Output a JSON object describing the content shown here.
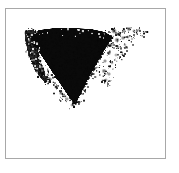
{
  "image": {
    "width": 179,
    "height": 173,
    "background_color": "#ffffff",
    "alt_label": "grainy dark ink blot shape"
  },
  "frame": {
    "name": "image-border-frame",
    "x": 5,
    "y": 8,
    "width": 161,
    "height": 151,
    "border_color": "#a8a8a8",
    "border_width": 1,
    "fill_color": "#ffffff"
  },
  "blob": {
    "name": "ink-blot-shape",
    "description": "dark grainy wedge tapering downward to a point",
    "ink_color": "#0a0a0a",
    "speckle_color": "#555555",
    "bounds": {
      "left": 24,
      "top": 26,
      "right": 148,
      "bottom": 108
    },
    "core_polygon": [
      [
        30,
        34
      ],
      [
        38,
        29
      ],
      [
        54,
        27
      ],
      [
        72,
        27
      ],
      [
        90,
        28
      ],
      [
        104,
        31
      ],
      [
        112,
        36
      ],
      [
        104,
        48
      ],
      [
        96,
        62
      ],
      [
        88,
        76
      ],
      [
        80,
        92
      ],
      [
        74,
        104
      ],
      [
        68,
        96
      ],
      [
        60,
        84
      ],
      [
        52,
        72
      ],
      [
        44,
        60
      ],
      [
        36,
        48
      ],
      [
        30,
        40
      ]
    ],
    "left_wing_polygon": [
      [
        24,
        30
      ],
      [
        34,
        28
      ],
      [
        40,
        38
      ],
      [
        38,
        54
      ],
      [
        42,
        68
      ],
      [
        50,
        80
      ],
      [
        44,
        82
      ],
      [
        34,
        70
      ],
      [
        27,
        52
      ],
      [
        24,
        38
      ]
    ],
    "speckles": [
      {
        "x": 113,
        "y": 30,
        "r": 3.0,
        "a": 0.8
      },
      {
        "x": 118,
        "y": 33,
        "r": 2.6,
        "a": 0.7
      },
      {
        "x": 123,
        "y": 30,
        "r": 2.2,
        "a": 0.62
      },
      {
        "x": 128,
        "y": 28,
        "r": 2.6,
        "a": 0.72
      },
      {
        "x": 133,
        "y": 30,
        "r": 2.0,
        "a": 0.55
      },
      {
        "x": 138,
        "y": 29,
        "r": 1.8,
        "a": 0.48
      },
      {
        "x": 143,
        "y": 31,
        "r": 1.5,
        "a": 0.35
      },
      {
        "x": 116,
        "y": 39,
        "r": 2.8,
        "a": 0.72
      },
      {
        "x": 122,
        "y": 37,
        "r": 2.4,
        "a": 0.6
      },
      {
        "x": 127,
        "y": 36,
        "r": 2.0,
        "a": 0.52
      },
      {
        "x": 131,
        "y": 38,
        "r": 1.7,
        "a": 0.42
      },
      {
        "x": 110,
        "y": 44,
        "r": 2.6,
        "a": 0.68
      },
      {
        "x": 117,
        "y": 46,
        "r": 2.2,
        "a": 0.55
      },
      {
        "x": 124,
        "y": 44,
        "r": 1.8,
        "a": 0.45
      },
      {
        "x": 108,
        "y": 52,
        "r": 2.4,
        "a": 0.62
      },
      {
        "x": 115,
        "y": 54,
        "r": 1.9,
        "a": 0.48
      },
      {
        "x": 121,
        "y": 51,
        "r": 1.5,
        "a": 0.33
      },
      {
        "x": 104,
        "y": 60,
        "r": 2.2,
        "a": 0.6
      },
      {
        "x": 111,
        "y": 62,
        "r": 1.8,
        "a": 0.45
      },
      {
        "x": 103,
        "y": 70,
        "r": 2.6,
        "a": 0.7
      },
      {
        "x": 108,
        "y": 73,
        "r": 2.2,
        "a": 0.58
      },
      {
        "x": 105,
        "y": 79,
        "r": 2.0,
        "a": 0.5
      },
      {
        "x": 112,
        "y": 68,
        "r": 1.5,
        "a": 0.32
      },
      {
        "x": 98,
        "y": 40,
        "r": 3.2,
        "a": 0.85
      },
      {
        "x": 100,
        "y": 50,
        "r": 2.8,
        "a": 0.75
      },
      {
        "x": 95,
        "y": 58,
        "r": 2.6,
        "a": 0.7
      },
      {
        "x": 92,
        "y": 66,
        "r": 2.4,
        "a": 0.62
      },
      {
        "x": 88,
        "y": 74,
        "r": 2.2,
        "a": 0.58
      },
      {
        "x": 84,
        "y": 82,
        "r": 2.0,
        "a": 0.52
      },
      {
        "x": 79,
        "y": 90,
        "r": 2.2,
        "a": 0.58
      },
      {
        "x": 75,
        "y": 98,
        "r": 2.4,
        "a": 0.62
      },
      {
        "x": 71,
        "y": 104,
        "r": 2.0,
        "a": 0.5
      },
      {
        "x": 66,
        "y": 98,
        "r": 2.2,
        "a": 0.55
      },
      {
        "x": 60,
        "y": 92,
        "r": 2.4,
        "a": 0.6
      },
      {
        "x": 55,
        "y": 86,
        "r": 2.2,
        "a": 0.55
      },
      {
        "x": 48,
        "y": 78,
        "r": 2.6,
        "a": 0.65
      },
      {
        "x": 42,
        "y": 70,
        "r": 2.4,
        "a": 0.6
      },
      {
        "x": 36,
        "y": 60,
        "r": 2.6,
        "a": 0.66
      },
      {
        "x": 30,
        "y": 50,
        "r": 2.8,
        "a": 0.7
      },
      {
        "x": 26,
        "y": 40,
        "r": 2.6,
        "a": 0.66
      },
      {
        "x": 25,
        "y": 32,
        "r": 2.4,
        "a": 0.6
      }
    ],
    "grain_seed": 20240517,
    "grain_density": 0.52
  },
  "blank_area": {
    "name": "empty-lower-panel",
    "description": "white unmarked region below the blot"
  }
}
